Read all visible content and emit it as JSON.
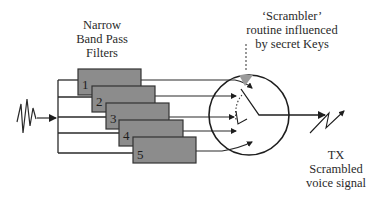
{
  "diagram": {
    "title_filters": [
      "Narrow",
      "Band Pass",
      "Filters"
    ],
    "title_scrambler": [
      "‘Scrambler’",
      "routine influenced",
      "by secret Keys"
    ],
    "title_output": [
      "TX",
      "Scrambled",
      "voice signal"
    ],
    "filters": [
      {
        "label": "1"
      },
      {
        "label": "2"
      },
      {
        "label": "3"
      },
      {
        "label": "4"
      },
      {
        "label": "5"
      }
    ],
    "colors": {
      "filter_fill": "#8c8c8c",
      "filter_stroke": "#333333",
      "line": "#2a2a2a",
      "key_marker": "#9a9a9a"
    },
    "nodes": [
      {
        "id": "input",
        "label": "voice input waveform"
      },
      {
        "id": "splitter",
        "label": "signal splitter bus"
      },
      {
        "id": "filters",
        "label": "Narrow Band Pass Filters 1-5"
      },
      {
        "id": "scrambler",
        "label": "Scrambler switch"
      },
      {
        "id": "tx",
        "label": "TX Scrambled voice signal"
      }
    ]
  }
}
